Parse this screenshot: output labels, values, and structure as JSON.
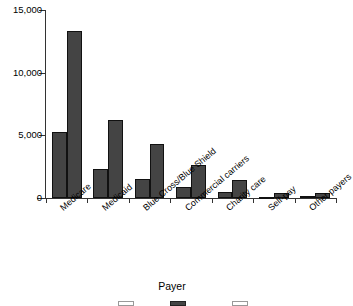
{
  "chart_data": {
    "type": "bar",
    "title": "",
    "subtitle": "",
    "xlabel": "Payer",
    "ylabel": "",
    "categories": [
      "Medicare",
      "Medicaid",
      "Blue Cross/Blue Shield",
      "Commercial carriers",
      "Charity care",
      "Self-pay",
      "Other payers"
    ],
    "series": [
      {
        "name": "Series 1",
        "color": "#444444",
        "values": [
          5250,
          2350,
          1500,
          900,
          480,
          110,
          130
        ]
      },
      {
        "name": "Series 2",
        "color": "#444444",
        "values": [
          13300,
          6200,
          4300,
          2620,
          1420,
          380,
          430
        ]
      }
    ],
    "ylim": [
      0,
      15000
    ],
    "yticks": [
      0,
      5000,
      10000,
      15000
    ],
    "ytick_labels": [
      "0",
      "5,000",
      "10,000",
      "15,000"
    ],
    "grid": false,
    "legend_position": "bottom",
    "legend_clipped": true
  },
  "axes": {
    "y_ticks": [
      {
        "label": "15,000",
        "value": 15000
      },
      {
        "label": "10,000",
        "value": 10000
      },
      {
        "label": "5,000",
        "value": 5000
      },
      {
        "label": "0",
        "value": 0
      }
    ],
    "x_title": "Payer"
  },
  "legend": {
    "items": [
      {
        "label": "",
        "fill": "open"
      },
      {
        "label": "",
        "fill": "filled"
      },
      {
        "label": "",
        "fill": "open"
      }
    ]
  }
}
